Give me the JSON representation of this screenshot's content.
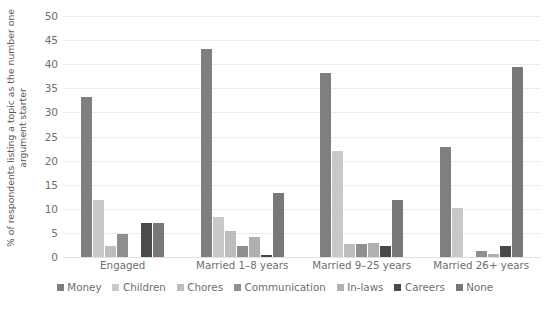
{
  "chart_data": {
    "type": "bar",
    "title": "",
    "subtitle": "",
    "xlabel": "",
    "ylabel": "% of respondents listing a topic as the number one argument starter",
    "ylim": [
      0,
      50
    ],
    "ytick_step": 5,
    "yticks": [
      "50",
      "45",
      "40",
      "35",
      "30",
      "25",
      "20",
      "15",
      "10",
      "5",
      "0"
    ],
    "grid": true,
    "legend_position": "bottom",
    "categories": [
      "Engaged",
      "Married 1–8 years",
      "Married 9–25 years",
      "Married 26+ years"
    ],
    "series": [
      {
        "name": "Money",
        "color": "#7f7f7f",
        "values": [
          33.2,
          43.2,
          38.2,
          22.8
        ]
      },
      {
        "name": "Children",
        "color": "#c9c9c9",
        "values": [
          11.8,
          8.3,
          22.0,
          10.2
        ]
      },
      {
        "name": "Chores",
        "color": "#bdbdbd",
        "values": [
          2.3,
          5.3,
          2.7,
          0.0
        ]
      },
      {
        "name": "Communication",
        "color": "#8f8f8f",
        "values": [
          4.7,
          2.3,
          2.7,
          1.2
        ]
      },
      {
        "name": "In-laws",
        "color": "#b0b0b0",
        "values": [
          0.0,
          4.2,
          3.0,
          0.6
        ]
      },
      {
        "name": "Careers",
        "color": "#4a4a4a",
        "values": [
          7.0,
          0.5,
          2.2,
          2.3
        ]
      },
      {
        "name": "None",
        "color": "#787878",
        "values": [
          7.0,
          13.3,
          11.9,
          39.5
        ]
      }
    ]
  },
  "colors": {
    "gridline": "#ececec",
    "baseline": "#e0e0e0",
    "text": "#6e6e6e",
    "background": "#ffffff"
  }
}
